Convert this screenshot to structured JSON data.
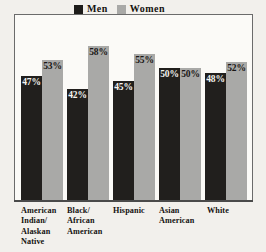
{
  "chart_data": {
    "type": "bar",
    "title": "",
    "subtitle": "",
    "xlabel": "",
    "ylabel": "",
    "ylim": [
      0,
      100
    ],
    "grid": false,
    "legend_position": "top-center",
    "categories": [
      "American Indian/ Alaskan Native",
      "Black/ African American",
      "Hispanic",
      "Asian American",
      "White"
    ],
    "category_lines": [
      [
        "American",
        "Indian/",
        "Alaskan",
        "Native"
      ],
      [
        "Black/",
        "African",
        "American"
      ],
      [
        "Hispanic"
      ],
      [
        "Asian",
        "American"
      ],
      [
        "White"
      ]
    ],
    "series": [
      {
        "name": "Men",
        "color": "#211f1d",
        "values": [
          47,
          42,
          45,
          50,
          48
        ],
        "labels": [
          "47%",
          "42%",
          "45%",
          "50%",
          "48%"
        ]
      },
      {
        "name": "Women",
        "color": "#a9a9a7",
        "values": [
          53,
          58,
          55,
          50,
          52
        ],
        "labels": [
          "53%",
          "58%",
          "55%",
          "50%",
          "52%"
        ]
      }
    ]
  },
  "legend": {
    "entries": [
      {
        "label": "Men",
        "swatch": "men-swatch"
      },
      {
        "label": "Women",
        "swatch": "women-swatch"
      }
    ]
  }
}
